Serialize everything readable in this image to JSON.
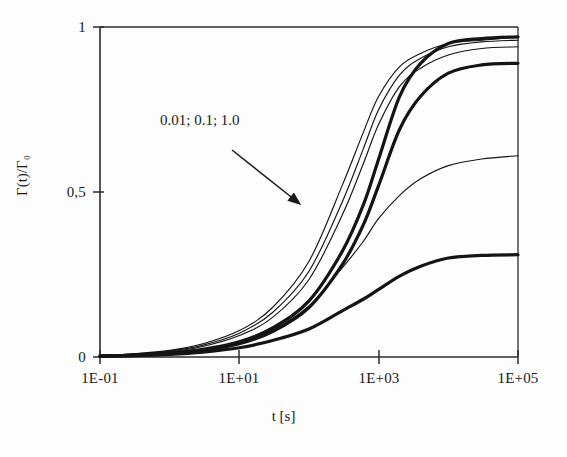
{
  "figure": {
    "background_color": "#fdfdfd",
    "ink_color": "#1a1a1a"
  },
  "annotation": {
    "series_label": "0.01; 0.1; 1.0"
  },
  "chart_data": {
    "type": "line",
    "title": "",
    "subtitle": "",
    "xlabel": "t [s]",
    "ylabel": "Γ(t)/Γ₀",
    "xscale": "log",
    "yscale": "linear",
    "xlim": [
      0.1,
      100000
    ],
    "ylim": [
      0,
      1
    ],
    "grid": false,
    "legend": "none",
    "x_tick_labels": [
      "1E-01",
      "1E+01",
      "1E+03",
      "1E+05"
    ],
    "x_tick_values": [
      0.1,
      10,
      1000,
      100000
    ],
    "y_tick_labels": [
      "0",
      "0,5",
      "1"
    ],
    "y_tick_values": [
      0,
      0.5,
      1
    ],
    "annotations": [
      {
        "text": "0.01; 0.1; 1.0",
        "points_to": "thin-curve-cluster",
        "arrow": true
      }
    ],
    "series": [
      {
        "name": "thin-a",
        "style": "thin",
        "plateau": 0.97,
        "x": [
          0.1,
          0.3,
          1,
          3,
          10,
          30,
          100,
          300,
          600,
          1000,
          2000,
          4000,
          10000,
          30000,
          100000
        ],
        "values": [
          0.005,
          0.01,
          0.02,
          0.04,
          0.08,
          0.15,
          0.29,
          0.52,
          0.68,
          0.79,
          0.88,
          0.92,
          0.95,
          0.96,
          0.97
        ]
      },
      {
        "name": "thin-b",
        "style": "thin",
        "plateau": 0.96,
        "x": [
          0.1,
          0.3,
          1,
          3,
          10,
          30,
          100,
          300,
          600,
          1000,
          2000,
          4000,
          10000,
          30000,
          100000
        ],
        "values": [
          0.004,
          0.009,
          0.018,
          0.036,
          0.072,
          0.135,
          0.26,
          0.47,
          0.63,
          0.75,
          0.855,
          0.905,
          0.94,
          0.955,
          0.96
        ]
      },
      {
        "name": "thin-c",
        "style": "thin",
        "plateau": 0.94,
        "x": [
          0.1,
          0.3,
          1,
          3,
          10,
          30,
          100,
          300,
          600,
          1000,
          2000,
          4000,
          10000,
          30000,
          100000
        ],
        "values": [
          0.004,
          0.008,
          0.016,
          0.032,
          0.065,
          0.12,
          0.235,
          0.43,
          0.585,
          0.705,
          0.82,
          0.875,
          0.915,
          0.935,
          0.94
        ]
      },
      {
        "name": "thick-a",
        "style": "thick",
        "plateau": 0.97,
        "x": [
          0.1,
          0.3,
          1,
          3,
          10,
          30,
          100,
          300,
          600,
          1000,
          2000,
          4000,
          10000,
          30000,
          100000
        ],
        "values": [
          0.003,
          0.006,
          0.012,
          0.023,
          0.046,
          0.088,
          0.17,
          0.32,
          0.46,
          0.6,
          0.79,
          0.89,
          0.95,
          0.965,
          0.97
        ]
      },
      {
        "name": "thick-b",
        "style": "thick",
        "plateau": 0.89,
        "x": [
          0.1,
          0.3,
          1,
          3,
          10,
          30,
          100,
          300,
          600,
          1000,
          2000,
          4000,
          10000,
          30000,
          100000
        ],
        "values": [
          0.003,
          0.005,
          0.01,
          0.02,
          0.04,
          0.077,
          0.15,
          0.28,
          0.4,
          0.52,
          0.69,
          0.79,
          0.86,
          0.885,
          0.89
        ]
      },
      {
        "name": "thin-d",
        "style": "thin",
        "plateau": 0.61,
        "x": [
          0.1,
          0.3,
          1,
          3,
          10,
          30,
          100,
          300,
          600,
          1000,
          2000,
          4000,
          10000,
          30000,
          100000
        ],
        "values": [
          0.003,
          0.006,
          0.011,
          0.022,
          0.043,
          0.082,
          0.155,
          0.27,
          0.35,
          0.42,
          0.49,
          0.54,
          0.58,
          0.6,
          0.61
        ]
      },
      {
        "name": "thick-c",
        "style": "thick",
        "plateau": 0.31,
        "x": [
          0.1,
          0.3,
          1,
          3,
          10,
          30,
          100,
          300,
          600,
          1000,
          2000,
          4000,
          10000,
          30000,
          100000
        ],
        "values": [
          0.002,
          0.004,
          0.008,
          0.015,
          0.028,
          0.05,
          0.085,
          0.14,
          0.175,
          0.205,
          0.245,
          0.275,
          0.3,
          0.308,
          0.31
        ]
      }
    ]
  }
}
